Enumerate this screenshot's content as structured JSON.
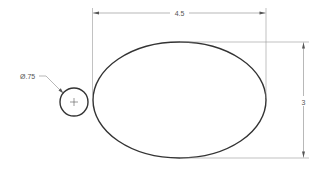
{
  "drawing": {
    "type": "technical-drawing",
    "colors": {
      "background": "#ffffff",
      "geometry": "#333333",
      "dimension": "#888888",
      "text": "#555555"
    },
    "ellipse": {
      "cx": 179.5,
      "cy": 100,
      "rx": 86.5,
      "ry": 58
    },
    "small_circle": {
      "cx": 74,
      "cy": 102,
      "r": 14
    },
    "dimensions": {
      "width": {
        "label": "4.5"
      },
      "height": {
        "label": "3"
      },
      "diameter": {
        "label": "Ø.75"
      }
    }
  }
}
